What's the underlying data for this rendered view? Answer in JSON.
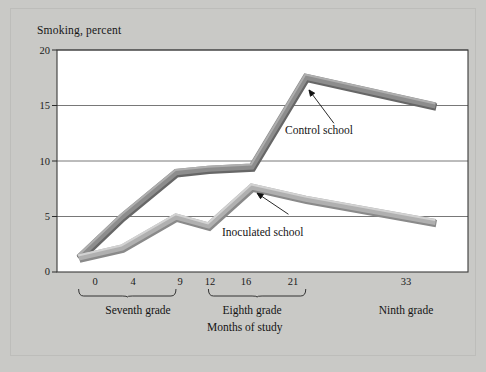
{
  "figure": {
    "background_color": "#c9c9c6",
    "plot_background_color": "#ffffff",
    "frame_color": "#3a3a3a"
  },
  "chart_data": {
    "type": "line",
    "title": "Smoking, percent",
    "xlabel": "Months of study",
    "ylabel": "Smoking, percent",
    "x": [
      0,
      4,
      9,
      12,
      16,
      21,
      33
    ],
    "xticklabels": [
      "0",
      "4",
      "9",
      "12",
      "16",
      "21",
      "33"
    ],
    "yticklabels": [
      "0",
      "5",
      "10",
      "15",
      "20"
    ],
    "yticks": [
      0,
      5,
      10,
      15,
      20
    ],
    "xlim": [
      -2,
      36
    ],
    "ylim": [
      0,
      20
    ],
    "grid": "horizontal",
    "legend_position": "inline-annotations",
    "series": [
      {
        "name": "Control school",
        "color": "#8d8d8d",
        "values": [
          1.3,
          5.0,
          9.0,
          9.3,
          9.5,
          17.6,
          15.0
        ]
      },
      {
        "name": "Inoculated school",
        "color": "#b0b0b0",
        "values": [
          1.3,
          2.2,
          5.0,
          4.2,
          7.7,
          6.6,
          4.5
        ]
      }
    ],
    "annotations": [
      {
        "text": "Control school",
        "points_to_x": 21,
        "points_to_y": 17.0
      },
      {
        "text": "Inoculated school",
        "points_to_x": 16,
        "points_to_y": 7.4
      }
    ],
    "group_brackets": [
      {
        "label": "Seventh grade",
        "from_x": 0,
        "to_x": 9
      },
      {
        "label": "Eighth grade",
        "from_x": 12,
        "to_x": 21
      },
      {
        "label": "Ninth grade",
        "from_x": 33,
        "to_x": 33,
        "no_bracket": true
      }
    ]
  }
}
